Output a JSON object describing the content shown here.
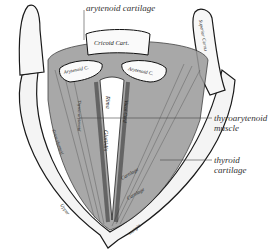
{
  "figure": {
    "callouts": [
      {
        "id": "arytenoid",
        "text": "arytenoid cartilage"
      },
      {
        "id": "thyroarytenoid",
        "line1": "thyroarytenoid",
        "line2": "muscle"
      },
      {
        "id": "thyroid",
        "line1": "thyroid",
        "line2": "cartilage"
      }
    ],
    "inline_labels": {
      "cricoid": "Cricoid Cart.",
      "arytenoid_left": "Arytenoid C.",
      "arytenoid_right": "Arytenoid C.",
      "superior_cornu": "Superior Cornu",
      "rima": "Rima",
      "glottidis": "Glottidis",
      "vocal_cord": "Vocal Cord",
      "thyreo_arytenoid": "Thyreo-arytenoid",
      "crico_thyreoid": "Crico-thyreoid",
      "cartilage_inner": "Cartilage",
      "cartilage_outer": "Cartilage",
      "upper": "Upper",
      "margin": "margin"
    },
    "colors": {
      "ink": "#1a1a1a",
      "paper": "#ffffff",
      "label": "#333333"
    }
  }
}
